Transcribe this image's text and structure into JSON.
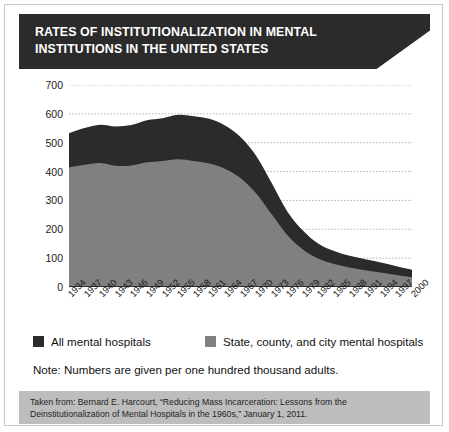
{
  "header": {
    "title": "RATES OF INSTITUTIONALIZATION IN MENTAL INSTITUTIONS IN THE UNITED STATES"
  },
  "legend": {
    "items": [
      {
        "label": "All mental hospitals",
        "color": "#2b2b2b"
      },
      {
        "label": "State, county, and city mental hospitals",
        "color": "#808080"
      }
    ]
  },
  "note": "Note: Numbers are given per one hundred thousand adults.",
  "footer": {
    "text": "Taken from: Bernard E. Harcourt, “Reducing Mass Incarceration: Lessons from the Deinstitutionalization of Mental Hospitals in the 1960s,” January 1, 2011."
  },
  "chart_data": {
    "type": "area",
    "stacked": false,
    "title": "RATES OF INSTITUTIONALIZATION IN MENTAL INSTITUTIONS IN THE UNITED STATES",
    "xlabel": "",
    "ylabel": "",
    "ylim": [
      0,
      700
    ],
    "yticks": [
      0,
      100,
      200,
      300,
      400,
      500,
      600,
      700
    ],
    "grid": true,
    "legend_position": "below",
    "x": [
      1934,
      1937,
      1940,
      1943,
      1946,
      1949,
      1952,
      1955,
      1958,
      1961,
      1964,
      1967,
      1970,
      1973,
      1976,
      1979,
      1982,
      1985,
      1988,
      1991,
      1994,
      1997,
      2000
    ],
    "xticklabels": [
      "1934",
      "1937",
      "1940",
      "1943",
      "1946",
      "1949",
      "1952",
      "1955",
      "1958",
      "1961",
      "1964",
      "1967",
      "1970",
      "1973",
      "1976",
      "1979",
      "1982",
      "1985",
      "1988",
      "1991",
      "1994",
      "1997",
      "2000"
    ],
    "series": [
      {
        "name": "All mental hospitals",
        "color": "#2b2b2b",
        "values": [
          533,
          551,
          562,
          556,
          561,
          578,
          585,
          597,
          592,
          583,
          560,
          520,
          455,
          360,
          262,
          196,
          150,
          125,
          108,
          96,
          85,
          72,
          60
        ]
      },
      {
        "name": "State, county, and city mental hospitals",
        "color": "#808080",
        "values": [
          415,
          424,
          430,
          420,
          421,
          432,
          437,
          443,
          437,
          428,
          410,
          378,
          325,
          252,
          180,
          130,
          98,
          80,
          68,
          58,
          50,
          42,
          34
        ]
      }
    ]
  }
}
